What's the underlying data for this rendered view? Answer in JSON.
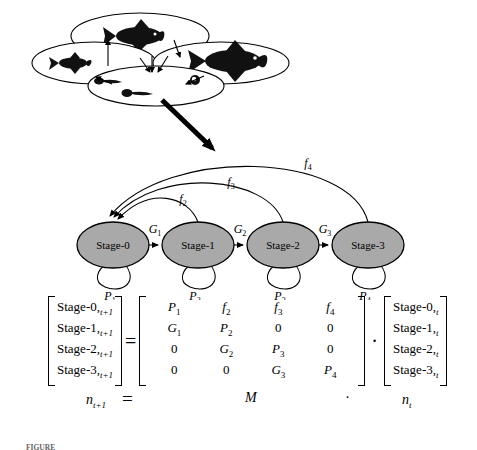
{
  "figure": {
    "title_caption": "FIGURE",
    "life_cycle": {
      "name": "fish-life-cycle-ovals",
      "ovals": [
        {
          "id": "oval-top",
          "contents": "adult-fish-silhouette"
        },
        {
          "id": "oval-left",
          "contents": "juvenile-fish-silhouette"
        },
        {
          "id": "oval-right",
          "contents": "large-adult-fish-silhouette"
        },
        {
          "id": "oval-bottom",
          "contents": "larvae-and-egg-silhouettes"
        }
      ],
      "transition_arrow": "large-down-right-arrow"
    },
    "graph": {
      "nodes": [
        {
          "id": "stage-0",
          "label": "Stage-0",
          "cx": 113,
          "cy": 245
        },
        {
          "id": "stage-1",
          "label": "Stage-1",
          "cx": 198,
          "cy": 245
        },
        {
          "id": "stage-2",
          "label": "Stage-2",
          "cx": 283,
          "cy": 245
        },
        {
          "id": "stage-3",
          "label": "Stage-3",
          "cx": 368,
          "cy": 245
        }
      ],
      "node_fill": "#a9a9a9",
      "node_stroke": "#000000",
      "growth_edges": [
        {
          "id": "g1",
          "base": "G",
          "sub": "1",
          "from": "stage-0",
          "to": "stage-1"
        },
        {
          "id": "g2",
          "base": "G",
          "sub": "2",
          "from": "stage-1",
          "to": "stage-2"
        },
        {
          "id": "g3",
          "base": "G",
          "sub": "3",
          "from": "stage-2",
          "to": "stage-3"
        }
      ],
      "survival_loops": [
        {
          "id": "p1",
          "base": "P",
          "sub": "1",
          "node": "stage-0"
        },
        {
          "id": "p2",
          "base": "P",
          "sub": "2",
          "node": "stage-1"
        },
        {
          "id": "p3",
          "base": "P",
          "sub": "3",
          "node": "stage-2"
        },
        {
          "id": "p4",
          "base": "P",
          "sub": "4",
          "node": "stage-3"
        }
      ],
      "fecundity_arcs": [
        {
          "id": "f2",
          "base": "f",
          "sub": "2",
          "from": "stage-1",
          "to": "stage-0"
        },
        {
          "id": "f3",
          "base": "f",
          "sub": "3",
          "from": "stage-2",
          "to": "stage-0"
        },
        {
          "id": "f4",
          "base": "f",
          "sub": "4",
          "from": "stage-3",
          "to": "stage-0"
        }
      ]
    },
    "equation": {
      "left_vector": {
        "name": "n-next-vector",
        "cells": [
          "Stage-0,",
          "Stage-1,",
          "Stage-2,",
          "Stage-3,"
        ],
        "subscript": "t+1",
        "bottom_label_base": "n",
        "bottom_label_sub": "t+1"
      },
      "equals_sign": "=",
      "matrix": {
        "name": "transition-matrix-M",
        "rows": [
          [
            {
              "v": "P",
              "s": "1",
              "i": true
            },
            {
              "v": "f",
              "s": "2",
              "i": true
            },
            {
              "v": "f",
              "s": "3",
              "i": true
            },
            {
              "v": "f",
              "s": "4",
              "i": true
            }
          ],
          [
            {
              "v": "G",
              "s": "1",
              "i": true
            },
            {
              "v": "P",
              "s": "2",
              "i": true
            },
            {
              "v": "0",
              "s": "",
              "i": false
            },
            {
              "v": "0",
              "s": "",
              "i": false
            }
          ],
          [
            {
              "v": "0",
              "s": "",
              "i": false
            },
            {
              "v": "G",
              "s": "2",
              "i": true
            },
            {
              "v": "P",
              "s": "3",
              "i": true
            },
            {
              "v": "0",
              "s": "",
              "i": false
            }
          ],
          [
            {
              "v": "0",
              "s": "",
              "i": false
            },
            {
              "v": "0",
              "s": "",
              "i": false
            },
            {
              "v": "G",
              "s": "3",
              "i": true
            },
            {
              "v": "P",
              "s": "4",
              "i": true
            }
          ]
        ],
        "bottom_label": "M"
      },
      "dot_operator": "·",
      "right_vector": {
        "name": "n-current-vector",
        "cells": [
          "Stage-0,",
          "Stage-1,",
          "Stage-2,",
          "Stage-3,"
        ],
        "subscript": "t",
        "bottom_label_base": "n",
        "bottom_label_sub": "t"
      }
    }
  }
}
